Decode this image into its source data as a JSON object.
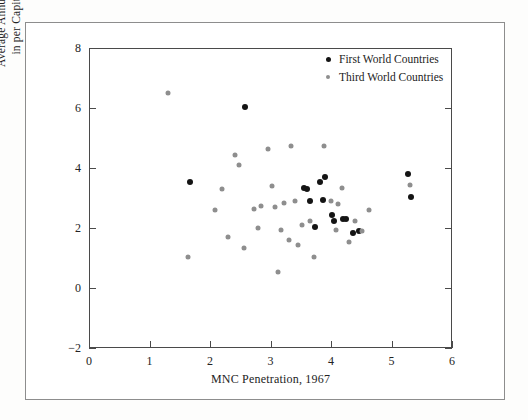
{
  "figure": {
    "background_color": "#ffffff",
    "frame_color": "#8d8d8d",
    "axis_color": "#4a4a4a"
  },
  "legend": {
    "position": "top-right",
    "entries": [
      {
        "label": "First World Countries",
        "marker": "filled-circle",
        "color": "#141414"
      },
      {
        "label": "Third World Countries",
        "marker": "filled-circle",
        "color": "#8e8e8e"
      }
    ]
  },
  "axis": {
    "x_title": "MNC Penetration, 1967",
    "y_title_line1": "Average Annual Percentage Growth",
    "y_title_line2": "in per Capita GNP, 1960–1982",
    "x_ticks": [
      "0",
      "1",
      "2",
      "3",
      "4",
      "5",
      "6"
    ],
    "y_ticks": [
      "−2",
      "0",
      "2",
      "4",
      "6",
      "8"
    ]
  },
  "chart_data": {
    "type": "scatter",
    "title": "",
    "xlabel": "MNC Penetration, 1967",
    "ylabel": "Average Annual Percentage Growth in per Capita GNP, 1960–1982",
    "xlim": [
      0,
      6
    ],
    "ylim": [
      -2,
      8
    ],
    "grid": false,
    "legend_position": "top-right",
    "series": [
      {
        "name": "First World Countries",
        "color": "#141414",
        "points": [
          [
            1.67,
            3.55
          ],
          [
            2.58,
            6.05
          ],
          [
            3.55,
            3.35
          ],
          [
            3.6,
            3.3
          ],
          [
            3.66,
            2.9
          ],
          [
            3.73,
            2.05
          ],
          [
            3.82,
            3.55
          ],
          [
            3.86,
            2.95
          ],
          [
            3.9,
            3.7
          ],
          [
            4.02,
            2.45
          ],
          [
            4.05,
            2.25
          ],
          [
            4.2,
            2.3
          ],
          [
            4.24,
            2.3
          ],
          [
            4.37,
            1.85
          ],
          [
            4.46,
            1.9
          ],
          [
            5.27,
            3.8
          ],
          [
            5.33,
            3.05
          ]
        ]
      },
      {
        "name": "Third World Countries",
        "color": "#8e8e8e",
        "points": [
          [
            1.3,
            6.5
          ],
          [
            1.63,
            1.05
          ],
          [
            2.08,
            2.6
          ],
          [
            2.2,
            3.3
          ],
          [
            2.3,
            1.7
          ],
          [
            2.42,
            4.45
          ],
          [
            2.48,
            4.1
          ],
          [
            2.57,
            1.35
          ],
          [
            2.72,
            2.65
          ],
          [
            2.8,
            2.0
          ],
          [
            2.84,
            2.75
          ],
          [
            2.96,
            4.65
          ],
          [
            3.02,
            3.4
          ],
          [
            3.08,
            2.7
          ],
          [
            3.12,
            0.55
          ],
          [
            3.18,
            1.95
          ],
          [
            3.22,
            2.85
          ],
          [
            3.3,
            1.6
          ],
          [
            3.34,
            4.75
          ],
          [
            3.4,
            2.9
          ],
          [
            3.46,
            1.45
          ],
          [
            3.52,
            2.1
          ],
          [
            3.66,
            2.25
          ],
          [
            3.72,
            1.05
          ],
          [
            3.88,
            4.75
          ],
          [
            4.0,
            2.9
          ],
          [
            4.08,
            1.95
          ],
          [
            4.12,
            2.8
          ],
          [
            4.18,
            3.35
          ],
          [
            4.3,
            1.55
          ],
          [
            4.4,
            2.25
          ],
          [
            4.52,
            1.9
          ],
          [
            4.62,
            2.6
          ],
          [
            5.3,
            3.45
          ]
        ]
      }
    ]
  }
}
